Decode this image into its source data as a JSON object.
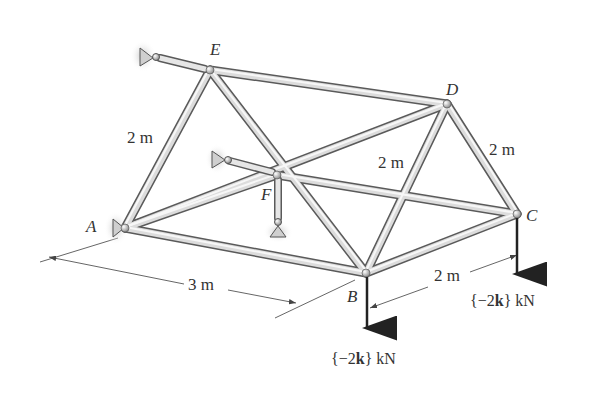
{
  "figure": {
    "type": "space truss",
    "nodes": {
      "A": {
        "label": "A"
      },
      "B": {
        "label": "B"
      },
      "C": {
        "label": "C"
      },
      "D": {
        "label": "D"
      },
      "E": {
        "label": "E"
      },
      "F": {
        "label": "F"
      }
    },
    "members": [
      "AE",
      "AB",
      "AF",
      "AD",
      "EF",
      "ED",
      "EB",
      "FB",
      "FC",
      "BD",
      "BC",
      "DC"
    ],
    "dimensions": {
      "AE": "2 m",
      "BD": "2 m",
      "DC": "2 m",
      "AB": "3 m",
      "BC": "2 m"
    },
    "loads": {
      "B": "{−2k} kN",
      "C": "{−2k} kN"
    },
    "load_parts": {
      "open": "{",
      "minus_two": "−2",
      "k": "k",
      "close": "}",
      "unit": "kN"
    },
    "supports": [
      "A",
      "E",
      "F"
    ]
  }
}
